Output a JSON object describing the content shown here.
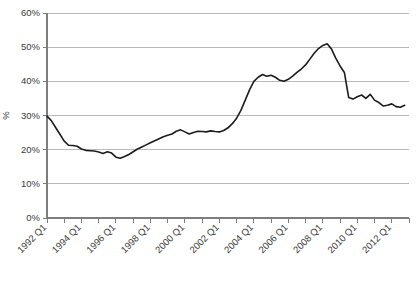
{
  "chart_data": {
    "type": "line",
    "title": "",
    "xlabel": "",
    "ylabel": "%",
    "ylim": [
      0,
      60
    ],
    "ytick_labels": [
      "0%",
      "10%",
      "20%",
      "30%",
      "40%",
      "50%",
      "60%"
    ],
    "ytick_values": [
      0,
      10,
      20,
      30,
      40,
      50,
      60
    ],
    "grid": true,
    "legend": "none",
    "xtick_labels": [
      "1992 Q1",
      "1994 Q1",
      "1996 Q1",
      "1998 Q1",
      "2000 Q1",
      "2002 Q1",
      "2004 Q1",
      "2006 Q1",
      "2008 Q1",
      "2010 Q1",
      "2012 Q1"
    ],
    "x_minor_step_years": 1,
    "x_start": 1992.0,
    "x_end": 2013.0,
    "series": [
      {
        "name": "series-1",
        "x": [
          1992.0,
          1992.25,
          1992.5,
          1992.75,
          1993.0,
          1993.25,
          1993.5,
          1993.75,
          1994.0,
          1994.25,
          1994.5,
          1994.75,
          1995.0,
          1995.25,
          1995.5,
          1995.75,
          1996.0,
          1996.25,
          1996.5,
          1996.75,
          1997.0,
          1997.25,
          1997.5,
          1997.75,
          1998.0,
          1998.25,
          1998.5,
          1998.75,
          1999.0,
          1999.25,
          1999.5,
          1999.75,
          2000.0,
          2000.25,
          2000.5,
          2000.75,
          2001.0,
          2001.25,
          2001.5,
          2001.75,
          2002.0,
          2002.25,
          2002.5,
          2002.75,
          2003.0,
          2003.25,
          2003.5,
          2003.75,
          2004.0,
          2004.25,
          2004.5,
          2004.75,
          2005.0,
          2005.25,
          2005.5,
          2005.75,
          2006.0,
          2006.25,
          2006.5,
          2006.75,
          2007.0,
          2007.25,
          2007.5,
          2007.75,
          2008.0,
          2008.25,
          2008.5,
          2008.75,
          2009.0,
          2009.25,
          2009.5,
          2009.75,
          2010.0,
          2010.25,
          2010.5,
          2010.75,
          2011.0,
          2011.25,
          2011.5,
          2011.75,
          2012.0,
          2012.25,
          2012.5,
          2012.75
        ],
        "values": [
          29.8,
          28.5,
          26.5,
          24.5,
          22.5,
          21.3,
          21.2,
          21.0,
          20.2,
          19.8,
          19.7,
          19.6,
          19.3,
          18.9,
          19.4,
          19.0,
          17.8,
          17.5,
          18.0,
          18.6,
          19.4,
          20.2,
          20.8,
          21.4,
          22.0,
          22.6,
          23.2,
          23.8,
          24.2,
          24.6,
          25.4,
          25.8,
          25.2,
          24.6,
          25.0,
          25.4,
          25.3,
          25.2,
          25.5,
          25.3,
          25.2,
          25.6,
          26.4,
          27.6,
          29.2,
          31.5,
          34.5,
          37.5,
          40.0,
          41.2,
          42.0,
          41.5,
          41.8,
          41.2,
          40.3,
          40.0,
          40.6,
          41.5,
          42.6,
          43.6,
          44.8,
          46.5,
          48.2,
          49.6,
          50.5,
          51.0,
          49.5,
          46.8,
          44.5,
          42.6,
          35.3,
          34.8,
          35.5,
          36.0,
          35.0,
          36.2,
          34.5,
          33.8,
          32.8,
          33.0,
          33.4,
          32.6,
          32.4,
          33.0
        ]
      }
    ]
  },
  "layout": {
    "plot_left": 47,
    "plot_right": 409,
    "plot_top": 13,
    "plot_bottom": 218
  }
}
